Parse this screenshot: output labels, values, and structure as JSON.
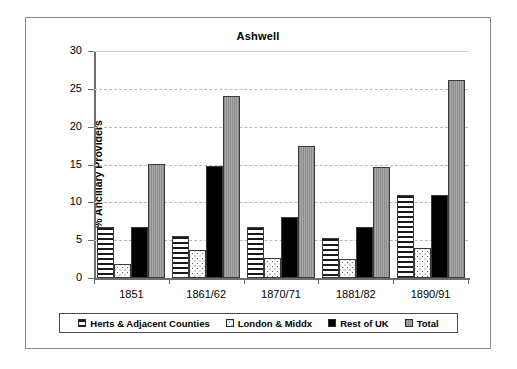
{
  "chart_data": {
    "type": "bar",
    "title": "Ashwell",
    "xlabel": "",
    "ylabel": "% Ancillary Providers",
    "ylim": [
      0,
      30
    ],
    "yticks": [
      0,
      5,
      10,
      15,
      20,
      25,
      30
    ],
    "ytick_labels": [
      "0",
      "5",
      "10",
      "15",
      "20",
      "25",
      "30"
    ],
    "grid": true,
    "legend_position": "bottom",
    "categories": [
      "1851",
      "1861/62",
      "1870/71",
      "1881/82",
      "1890/91"
    ],
    "series": [
      {
        "name": "Herts & Adjacent Counties",
        "pattern": "horizontal-stripes",
        "color": "#ffffff",
        "values": [
          6.7,
          5.6,
          6.7,
          5.3,
          11.0
        ]
      },
      {
        "name": "London & Middx",
        "pattern": "dotted",
        "color": "#ffffff",
        "values": [
          1.8,
          3.7,
          2.6,
          2.5,
          4.0
        ]
      },
      {
        "name": "Rest of UK",
        "pattern": "solid",
        "color": "#000000",
        "values": [
          6.7,
          14.8,
          8.1,
          6.7,
          11.0
        ]
      },
      {
        "name": "Total",
        "pattern": "grey-fill",
        "color": "#9e9e9e",
        "values": [
          15.1,
          24.0,
          17.5,
          14.7,
          26.2
        ]
      }
    ]
  },
  "legend": {
    "items": [
      {
        "label": "Herts & Adjacent Counties"
      },
      {
        "label": "London & Middx"
      },
      {
        "label": "Rest of UK"
      },
      {
        "label": "Total"
      }
    ]
  }
}
